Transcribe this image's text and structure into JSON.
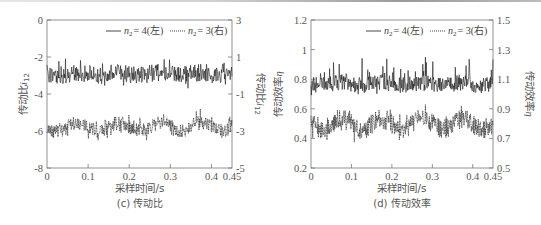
{
  "chart_data": [
    {
      "type": "line",
      "panel": "(c)",
      "caption": "(c) 传动比",
      "xlabel": "采样时间/s",
      "ylabel_left": "传动比 i12",
      "ylabel_right": "传动比 i12",
      "xlim": [
        0,
        0.45
      ],
      "ylim_left": [
        -8,
        0
      ],
      "ylim_right": [
        -5,
        3
      ],
      "x_ticks": [
        "0",
        "0.1",
        "0.2",
        "0.3",
        "0.4",
        "0.45"
      ],
      "y_ticks_left": [
        "0",
        "-2",
        "-4",
        "-6",
        "-8"
      ],
      "y_ticks_right": [
        "3",
        "1",
        "-1",
        "-3",
        "-5"
      ],
      "legend": [
        "n2 = 4(左)",
        "n2 = 3(右)"
      ],
      "legend_position": "top-right",
      "grid": false,
      "series": [
        {
          "name": "n2 = 4(左)",
          "axis": "left",
          "style": "solid",
          "mean": -2.9,
          "range": [
            -3.8,
            -1.8
          ]
        },
        {
          "name": "n2 = 3(右)",
          "axis": "right",
          "style": "dotted",
          "mean": -2.7,
          "range": [
            -3.5,
            -1.8
          ]
        }
      ]
    },
    {
      "type": "line",
      "panel": "(d)",
      "caption": "(d) 传动效率",
      "xlabel": "采样时间/s",
      "ylabel_left": "传动效率 η",
      "ylabel_right": "传动效率 η",
      "xlim": [
        0,
        0.45
      ],
      "ylim_left": [
        0.2,
        1.2
      ],
      "ylim_right": [
        0.5,
        1.5
      ],
      "x_ticks": [
        "0",
        "0.1",
        "0.2",
        "0.3",
        "0.4",
        "0.45"
      ],
      "y_ticks_left": [
        "1.2",
        "1",
        "0.8",
        "0.6",
        "0.4",
        "0.2"
      ],
      "y_ticks_right": [
        "1.5",
        "1.3",
        "1.1",
        "0.9",
        "0.7",
        "0.5"
      ],
      "legend": [
        "n2 = 4(左)",
        "n2 = 3(右)"
      ],
      "legend_position": "top-right",
      "grid": false,
      "series": [
        {
          "name": "n2 = 4(左)",
          "axis": "left",
          "style": "solid",
          "mean": 0.76,
          "range": [
            0.68,
            0.96
          ]
        },
        {
          "name": "n2 = 3(右)",
          "axis": "right",
          "style": "dotted",
          "mean": 0.78,
          "range": [
            0.65,
            1.0
          ]
        }
      ]
    }
  ],
  "left": {
    "caption": "(c) 传动比",
    "xlabel": "采样时间/s",
    "ylabel": "传动比",
    "ysub": "12",
    "ylabel_right": "传动比",
    "x_ticks": [
      "0",
      "0.1",
      "0.2",
      "0.3",
      "0.4",
      "0.45"
    ],
    "y_left": [
      "0",
      "-2",
      "-4",
      "-6",
      "-8"
    ],
    "y_right": [
      "3",
      "1",
      "-1",
      "-3",
      "-5"
    ],
    "legend1": "= 4(左)",
    "legend2": "= 3(右)",
    "legend_var": "n",
    "legend_sub": "2"
  },
  "right": {
    "caption": "(d) 传动效率",
    "xlabel": "采样时间/s",
    "ylabel": "传动效率",
    "ysym": "η",
    "x_ticks": [
      "0",
      "0.1",
      "0.2",
      "0.3",
      "0.4",
      "0.45"
    ],
    "y_left": [
      "1.2",
      "1",
      "0.8",
      "0.6",
      "0.4",
      "0.2"
    ],
    "y_right": [
      "1.5",
      "1.3",
      "1.1",
      "0.9",
      "0.7",
      "0.5"
    ],
    "legend1": "= 4(左)",
    "legend2": "= 3(右)",
    "legend_var": "n",
    "legend_sub": "2"
  }
}
